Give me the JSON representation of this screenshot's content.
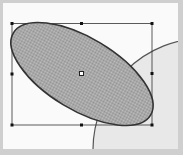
{
  "canvas": {
    "background": "#fafafa",
    "frame_color": "#cfcfcf"
  },
  "shapes": [
    {
      "type": "circle",
      "name": "background-circle",
      "fill": "#e6e6e6",
      "stroke": "#555555",
      "selected": false
    },
    {
      "type": "ellipse",
      "name": "selected-ellipse",
      "fill": "#a8a8a8",
      "fill_pattern": "checker-dither",
      "stroke": "#3a3a3a",
      "rotation_deg": 31,
      "selected": true
    }
  ],
  "selection": {
    "bounding_box": {
      "left": 12,
      "top": 23,
      "right": 152,
      "bottom": 125
    },
    "handle_count": 8,
    "center_point": true
  }
}
